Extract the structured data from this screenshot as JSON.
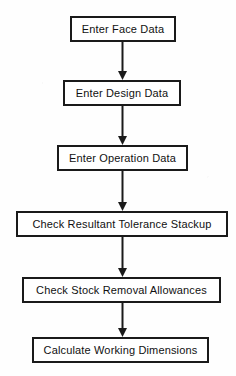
{
  "figure": {
    "width": 236,
    "height": 376,
    "background_color": "#fefefe",
    "line_color": "#1a1a1a",
    "text_color": "#111111",
    "caption_partial": "",
    "nodes": [
      {
        "id": "enter-face-data",
        "label": "Enter Face Data",
        "x": 70,
        "y": 16,
        "width": 106,
        "height": 26
      },
      {
        "id": "enter-design-data",
        "label": "Enter Design Data",
        "x": 63,
        "y": 80,
        "width": 118,
        "height": 26
      },
      {
        "id": "enter-operation-data",
        "label": "Enter Operation Data",
        "x": 57,
        "y": 145,
        "width": 131,
        "height": 26
      },
      {
        "id": "check-resultant-tolerance-stackup",
        "label": "Check Resultant Tolerance Stackup",
        "x": 16,
        "y": 211,
        "width": 212,
        "height": 26
      },
      {
        "id": "check-stock-removal-allowances",
        "label": "Check Stock Removal Allowances",
        "x": 22,
        "y": 277,
        "width": 199,
        "height": 26
      },
      {
        "id": "calculate-working-dimensions",
        "label": "Calculate Working Dimensions",
        "x": 32,
        "y": 337,
        "width": 177,
        "height": 26
      }
    ],
    "connectors": [
      {
        "id": "arrow-1",
        "from": "enter-face-data",
        "to": "enter-design-data",
        "x": 122,
        "y_start": 42,
        "y_end": 80
      },
      {
        "id": "arrow-2",
        "from": "enter-design-data",
        "to": "enter-operation-data",
        "x": 122,
        "y_start": 106,
        "y_end": 145
      },
      {
        "id": "arrow-3",
        "from": "enter-operation-data",
        "to": "check-resultant-tolerance-stackup",
        "x": 122,
        "y_start": 171,
        "y_end": 211
      },
      {
        "id": "arrow-4",
        "from": "check-resultant-tolerance-stackup",
        "to": "check-stock-removal-allowances",
        "x": 122,
        "y_start": 237,
        "y_end": 277
      },
      {
        "id": "arrow-5",
        "from": "check-stock-removal-allowances",
        "to": "calculate-working-dimensions",
        "x": 122,
        "y_start": 303,
        "y_end": 337
      }
    ]
  }
}
